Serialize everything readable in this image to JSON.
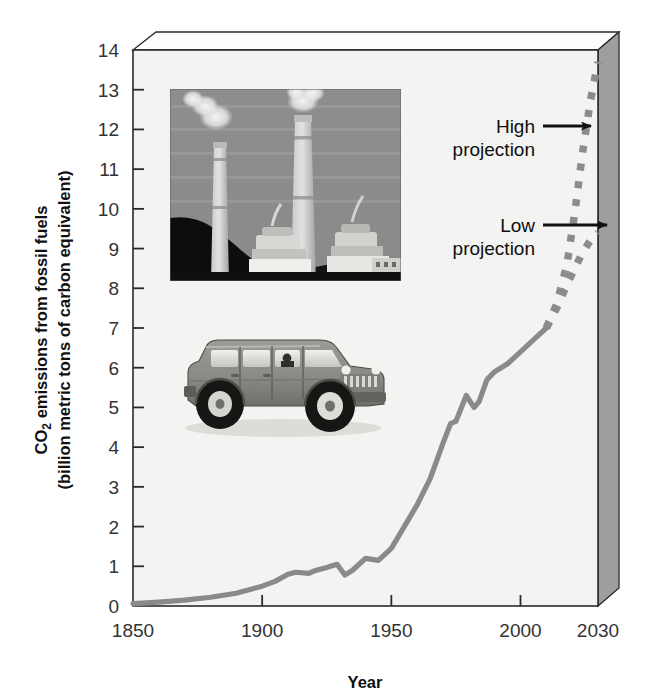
{
  "chart_data": {
    "type": "line",
    "title": "",
    "xlabel": "Year",
    "ylabel": "CO2 emissions from fossil fuels (billion metric tons of carbon equivalent)",
    "ylabel_line1_pre": "CO",
    "ylabel_line1_sub": "2",
    "ylabel_line1_post": " emissions from fossil fuels",
    "ylabel_line2": "(billion metric tons of carbon equivalent)",
    "xlim": [
      1850,
      2030
    ],
    "ylim": [
      0,
      14
    ],
    "grid": false,
    "legend_position": "none",
    "x_tick_labels": [
      "1850",
      "1900",
      "1950",
      "2000",
      "2030"
    ],
    "x_ticks": [
      1850,
      1900,
      1950,
      2000,
      2030
    ],
    "y_tick_labels": [
      "0",
      "1",
      "2",
      "3",
      "4",
      "5",
      "6",
      "7",
      "8",
      "9",
      "10",
      "11",
      "12",
      "13",
      "14"
    ],
    "y_ticks": [
      0,
      1,
      2,
      3,
      4,
      5,
      6,
      7,
      8,
      9,
      10,
      11,
      12,
      13,
      14
    ],
    "series": [
      {
        "name": "Historical emissions",
        "style": "solid",
        "color": "#8a8a8a",
        "x": [
          1850,
          1860,
          1870,
          1880,
          1890,
          1900,
          1905,
          1910,
          1913,
          1918,
          1920,
          1925,
          1929,
          1932,
          1935,
          1940,
          1945,
          1950,
          1955,
          1960,
          1965,
          1970,
          1973,
          1975,
          1979,
          1982,
          1984,
          1987,
          1990,
          1995,
          2000,
          2005,
          2010
        ],
        "values": [
          0.06,
          0.1,
          0.15,
          0.22,
          0.32,
          0.5,
          0.62,
          0.8,
          0.85,
          0.82,
          0.88,
          0.97,
          1.05,
          0.78,
          0.9,
          1.2,
          1.15,
          1.45,
          2.0,
          2.55,
          3.2,
          4.1,
          4.6,
          4.65,
          5.3,
          5.0,
          5.15,
          5.7,
          5.9,
          6.1,
          6.4,
          6.7,
          7.0
        ]
      },
      {
        "name": "High projection",
        "style": "dashed",
        "color": "#8c8c8c",
        "x": [
          2010,
          2014,
          2018,
          2021,
          2024,
          2027,
          2030
        ],
        "values": [
          7.0,
          7.6,
          8.6,
          9.9,
          11.4,
          12.7,
          13.7
        ]
      },
      {
        "name": "Low projection",
        "style": "dashed",
        "color": "#8c8c8c",
        "x": [
          2010,
          2014,
          2018,
          2021,
          2024,
          2027,
          2030
        ],
        "values": [
          7.0,
          7.5,
          8.1,
          8.5,
          8.9,
          9.2,
          9.4
        ]
      }
    ],
    "annotations": [
      {
        "name": "high-projection",
        "line1": "High",
        "line2": "projection",
        "arrow": "right",
        "target_year": 2026,
        "target_value": 12.0
      },
      {
        "name": "low-projection",
        "line1": "Low",
        "line2": "projection",
        "arrow": "right",
        "target_year": 2030,
        "target_value": 9.4
      }
    ],
    "inset_images": [
      {
        "name": "power-plant-photo",
        "description": "Coal-fired power plant with two smokestacks emitting smoke"
      },
      {
        "name": "hummer-suv-photo",
        "description": "Hummer H1 sport utility vehicle"
      }
    ],
    "plot_style": {
      "box_3d": true,
      "panel_color": "#f2f2f0",
      "side_panel_color": "#9a9a9a",
      "top_panel_color": "#fbfbfb",
      "axis_color": "#2b2b2b"
    }
  }
}
